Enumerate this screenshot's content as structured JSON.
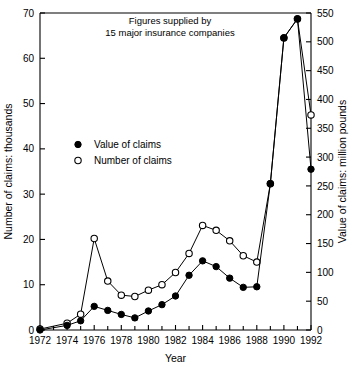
{
  "chart_data": {
    "type": "line",
    "title": "",
    "annotation": [
      "Figures supplied by",
      "15 major insurance companies"
    ],
    "xlabel": "Year",
    "ylabel": "Number of claims: thousands",
    "y2label": "Value of claims: million pounds",
    "xlim": [
      1972,
      1992
    ],
    "ylim": [
      0,
      70
    ],
    "y2lim": [
      0,
      550
    ],
    "xticks": [
      1972,
      1974,
      1976,
      1978,
      1980,
      1982,
      1984,
      1986,
      1988,
      1990,
      1992
    ],
    "xticklabels": [
      "1972",
      "1974",
      "1976",
      "1978",
      "1980",
      "1982",
      "1984",
      "1986",
      "1988",
      "1990",
      "1992"
    ],
    "xminorticks": [
      1973,
      1975,
      1977,
      1979,
      1981,
      1983,
      1985,
      1987,
      1989,
      1991
    ],
    "yticks": [
      0,
      10,
      20,
      30,
      40,
      50,
      60,
      70
    ],
    "yticklabels": [
      "0",
      "10",
      "20",
      "30",
      "40",
      "50",
      "60",
      "70"
    ],
    "y2ticks": [
      0,
      50,
      100,
      150,
      200,
      250,
      300,
      350,
      400,
      450,
      500,
      550
    ],
    "y2ticklabels": [
      "0",
      "50",
      "100",
      "150",
      "200",
      "250",
      "300",
      "350",
      "400",
      "450",
      "500",
      "550"
    ],
    "grid": false,
    "legend_position": "upper-left-inside",
    "x": [
      1972,
      1974,
      1975,
      1976,
      1977,
      1978,
      1979,
      1980,
      1981,
      1982,
      1983,
      1984,
      1985,
      1986,
      1987,
      1988,
      1989,
      1990,
      1991,
      1992
    ],
    "series": [
      {
        "name": "Value of claims",
        "marker": "filled-circle",
        "axis": "right",
        "values_left_scale": [
          0,
          1.0,
          2.0,
          5.2,
          4.3,
          3.4,
          2.7,
          4.2,
          5.6,
          7.5,
          12.1,
          15.3,
          14.0,
          11.5,
          9.4,
          9.6,
          32.3,
          64.5,
          68.7,
          35.5
        ],
        "values": [
          0,
          8,
          16,
          41,
          34,
          27,
          21,
          33,
          44,
          59,
          95,
          120,
          110,
          90,
          74,
          75,
          254,
          507,
          540,
          279
        ]
      },
      {
        "name": "Number of claims",
        "marker": "open-circle",
        "axis": "left",
        "values": [
          0.2,
          1.5,
          3.5,
          20.2,
          10.8,
          7.7,
          7.4,
          8.8,
          10.0,
          12.7,
          16.9,
          23.1,
          22.0,
          19.7,
          16.4,
          15.0,
          32.3,
          64.5,
          68.7,
          47.5
        ]
      }
    ],
    "legend": [
      {
        "label": "Value of claims",
        "marker": "filled-circle"
      },
      {
        "label": "Number of claims",
        "marker": "open-circle"
      }
    ]
  }
}
